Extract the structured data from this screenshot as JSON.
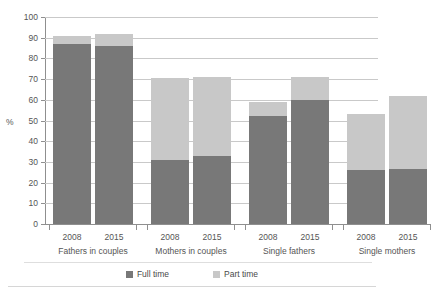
{
  "chart_data": {
    "type": "bar",
    "title": "",
    "xlabel": "",
    "ylabel": "%",
    "ylim": [
      0,
      100
    ],
    "ytick_step": 10,
    "yticks": [
      100,
      90,
      80,
      70,
      60,
      50,
      40,
      30,
      20,
      10,
      0
    ],
    "grid": true,
    "stacked": true,
    "legend_position": "bottom-center",
    "groups": [
      {
        "label": "Fathers in couples",
        "years": [
          "2008",
          "2015"
        ]
      },
      {
        "label": "Mothers in couples",
        "years": [
          "2008",
          "2015"
        ]
      },
      {
        "label": "Single fathers",
        "years": [
          "2008",
          "2015"
        ]
      },
      {
        "label": "Single mothers",
        "years": [
          "2008",
          "2015"
        ]
      }
    ],
    "categories": [
      "Fathers in couples 2008",
      "Fathers in couples 2015",
      "Mothers in couples 2008",
      "Mothers in couples 2015",
      "Single fathers 2008",
      "Single fathers 2015",
      "Single mothers 2008",
      "Single mothers 2015"
    ],
    "series": [
      {
        "name": "Full time",
        "color": "#787878",
        "values": [
          87,
          86,
          31,
          33,
          52,
          60,
          26,
          26.5
        ]
      },
      {
        "name": "Part time",
        "color": "#c8c8c8",
        "values": [
          4,
          6,
          39.5,
          38,
          7,
          11,
          27,
          35.5
        ]
      }
    ],
    "totals": [
      91,
      92,
      70.5,
      71,
      59,
      71,
      53,
      62
    ]
  },
  "axis": {
    "y_label": "%",
    "y_ticks": [
      "100",
      "90",
      "80",
      "70",
      "60",
      "50",
      "40",
      "30",
      "20",
      "10",
      "0"
    ]
  },
  "legend": {
    "items": [
      {
        "label": "Full time",
        "color": "#787878"
      },
      {
        "label": "Part time",
        "color": "#c8c8c8"
      }
    ]
  },
  "title_ghost": " "
}
